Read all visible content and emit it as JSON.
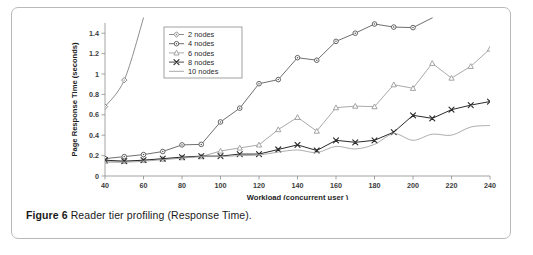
{
  "figure": {
    "caption_lead": "Figure 6",
    "caption_rest": " Reader tier profiling (Response Time)."
  },
  "chart_data": {
    "type": "line",
    "title": "",
    "xlabel": "Workload (concurrent user )",
    "ylabel": "Page Response Time (seconds)",
    "xlim": [
      40,
      240
    ],
    "ylim": [
      0,
      1.5
    ],
    "xticks": [
      40,
      60,
      80,
      100,
      120,
      140,
      160,
      180,
      200,
      220,
      240
    ],
    "xticklabels": [
      "40",
      "60",
      "80",
      "100",
      "120",
      "140",
      "160",
      "180",
      "200",
      "220",
      "240"
    ],
    "yticks": [
      0,
      0.2,
      0.4,
      0.6,
      0.8,
      1,
      1.2,
      1.4
    ],
    "yticklabels": [
      "0",
      "0.2",
      "0.4",
      "0.6",
      "0.8",
      "1",
      "1.2",
      "1.4"
    ],
    "grid": false,
    "legend_position": "upper-left-inside",
    "x": [
      40,
      50,
      60,
      70,
      80,
      90,
      100,
      110,
      120,
      130,
      140,
      150,
      160,
      170,
      180,
      190,
      200,
      210,
      220,
      230,
      240
    ],
    "series": [
      {
        "name": "2 nodes",
        "marker": "diamond",
        "color": "#7a7a7a",
        "values": [
          0.68,
          0.94,
          1.55,
          null,
          null,
          null,
          null,
          null,
          null,
          null,
          null,
          null,
          null,
          null,
          null,
          null,
          null,
          null,
          null,
          null,
          null
        ]
      },
      {
        "name": "4 nodes",
        "marker": "circle",
        "color": "#555555",
        "values": [
          0.17,
          0.19,
          0.21,
          0.24,
          0.305,
          0.31,
          0.53,
          0.665,
          0.905,
          0.945,
          1.16,
          1.135,
          1.32,
          1.4,
          1.49,
          1.46,
          1.455,
          1.55,
          null,
          null,
          null
        ]
      },
      {
        "name": "6 nodes",
        "marker": "triangle",
        "color": "#9a9a9a",
        "values": [
          0.145,
          0.145,
          0.155,
          0.165,
          0.18,
          0.19,
          0.245,
          0.275,
          0.305,
          0.455,
          0.575,
          0.44,
          0.67,
          0.685,
          0.68,
          0.895,
          0.86,
          1.105,
          0.96,
          1.075,
          1.245
        ]
      },
      {
        "name": "8 nodes",
        "marker": "x",
        "color": "#2b2b2b",
        "values": [
          0.155,
          0.145,
          0.155,
          0.17,
          0.185,
          0.195,
          0.195,
          0.215,
          0.215,
          0.26,
          0.305,
          0.25,
          0.35,
          0.33,
          0.35,
          0.43,
          0.595,
          0.565,
          0.65,
          0.695,
          0.73
        ]
      },
      {
        "name": "10 nodes",
        "marker": "none",
        "color": "#9e9e9e",
        "values": [
          0.135,
          0.135,
          0.145,
          0.16,
          0.175,
          0.19,
          0.19,
          0.2,
          0.205,
          0.235,
          0.255,
          0.23,
          0.29,
          0.265,
          0.31,
          0.415,
          0.35,
          0.41,
          0.4,
          0.48,
          0.495
        ]
      }
    ]
  }
}
